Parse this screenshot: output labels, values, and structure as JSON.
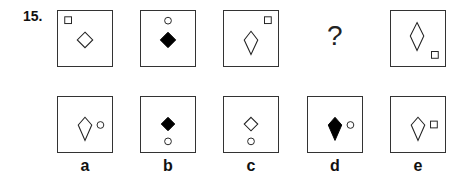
{
  "question_number": "15.",
  "missing_symbol": "?",
  "sequence": [
    {
      "id": "seq-1",
      "description": "small square top-left, outline diamond center"
    },
    {
      "id": "seq-2",
      "description": "small circle top-center, filled diamond center"
    },
    {
      "id": "seq-3",
      "description": "small square top-right, outline kite center"
    },
    {
      "id": "seq-4",
      "description": "missing"
    },
    {
      "id": "seq-5",
      "description": "outline tall rhombus center, small square bottom-right"
    }
  ],
  "options": [
    {
      "label": "a",
      "description": "outline kite, small circle right"
    },
    {
      "label": "b",
      "description": "filled diamond, small circle below"
    },
    {
      "label": "c",
      "description": "outline diamond, small circle below"
    },
    {
      "label": "d",
      "description": "filled kite, small circle right"
    },
    {
      "label": "e",
      "description": "outline kite, small square right"
    }
  ]
}
